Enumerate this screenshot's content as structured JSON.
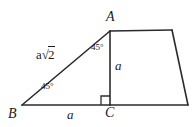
{
  "figure": {
    "stroke_color": "#2b2b2b",
    "background_color": "#ffffff",
    "vertices": {
      "A": {
        "label": "A",
        "x": 110,
        "y": 31
      },
      "B": {
        "label": "B",
        "x": 22,
        "y": 105
      },
      "C": {
        "label": "C",
        "x": 110,
        "y": 105
      },
      "D": {
        "label": "",
        "x": 172,
        "y": 30
      },
      "E": {
        "label": "",
        "x": 188,
        "y": 105
      }
    },
    "labels": {
      "hypotenuse": {
        "prefix": "a",
        "radical": "√",
        "radicand": "2"
      },
      "base": "a",
      "height": "a",
      "angle_at_A": "45°",
      "angle_at_B": "45°",
      "right_angle_at_C": "90°"
    },
    "segments": [
      {
        "name": "hypotenuse-BA",
        "from": "B",
        "to": "A"
      },
      {
        "name": "base-BC",
        "from": "B",
        "to": "C"
      },
      {
        "name": "altitude-AC",
        "from": "A",
        "to": "C"
      },
      {
        "name": "top-AD",
        "from": "A",
        "to": "D"
      },
      {
        "name": "right-DE",
        "from": "D",
        "to": "E"
      },
      {
        "name": "bottom-CE",
        "from": "C",
        "to": "E"
      }
    ]
  }
}
